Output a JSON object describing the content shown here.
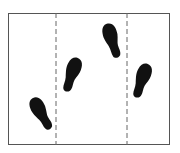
{
  "diagram": {
    "type": "footprint-sequence",
    "frame": {
      "x": 8,
      "y": 13,
      "width": 162,
      "height": 132,
      "stroke": "#555555"
    },
    "dividers": [
      {
        "x": 56,
        "style": "dashed",
        "color": "#666666"
      },
      {
        "x": 127,
        "style": "dashed",
        "color": "#666666"
      }
    ],
    "footprints": [
      {
        "id": 1,
        "cx": 41,
        "cy": 113,
        "rotation": -25,
        "color": "#111111"
      },
      {
        "id": 2,
        "cx": 72,
        "cy": 74,
        "rotation": 20,
        "color": "#111111"
      },
      {
        "id": 3,
        "cx": 112,
        "cy": 40,
        "rotation": -15,
        "color": "#111111"
      },
      {
        "id": 4,
        "cx": 142,
        "cy": 80,
        "rotation": 20,
        "color": "#111111"
      }
    ]
  }
}
